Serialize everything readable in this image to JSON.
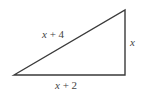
{
  "diagram": {
    "type": "right-triangle",
    "stroke_color": "#3a3a3a",
    "vertices": {
      "left": [
        14,
        75
      ],
      "top_right": [
        125,
        10
      ],
      "bottom_right": [
        125,
        75
      ]
    },
    "labels": {
      "hypotenuse": {
        "var": "x",
        "rest": " + 4"
      },
      "vertical_leg": {
        "var": "x",
        "rest": ""
      },
      "horizontal_leg": {
        "var": "x",
        "rest": " + 2"
      }
    }
  }
}
